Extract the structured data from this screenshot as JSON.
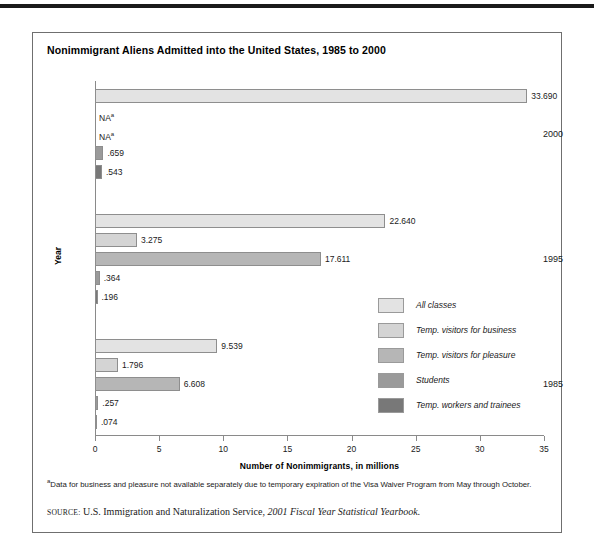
{
  "figure": {
    "title": "Nonimmigrant Aliens Admitted into the United States, 1985 to 2000",
    "footnote_marker": "a",
    "footnote_text": "Data for business and pleasure not available separately due to temporary expiration of the Visa Waiver Program from May through October.",
    "source_keyword": "SOURCE:",
    "source_text": "U.S. Immigration and Naturalization Service,",
    "source_italic": "2001 Fiscal Year Statistical Yearbook."
  },
  "chart_data": {
    "type": "bar",
    "orientation": "horizontal",
    "title": "Nonimmigrant Aliens Admitted into the United States, 1985 to 2000",
    "xlabel": "Number of Nonimmigrants, in millions",
    "ylabel": "Year",
    "xlim": [
      0,
      35
    ],
    "xticks": [
      0,
      5,
      10,
      15,
      20,
      25,
      30,
      35
    ],
    "grid": false,
    "legend_position": "right-middle",
    "categories": [
      "2000",
      "1995",
      "1985"
    ],
    "series": [
      {
        "name": "All classes",
        "color": "#e3e3e3",
        "values": [
          33.69,
          22.64,
          9.539
        ],
        "labels": [
          "33.690",
          "22.640",
          "9.539"
        ]
      },
      {
        "name": "Temp. visitors for business",
        "color": "#d4d4d4",
        "values": [
          null,
          3.275,
          1.796
        ],
        "labels": [
          "NA",
          "3.275",
          "1.796"
        ]
      },
      {
        "name": "Temp. visitors for pleasure",
        "color": "#b6b6b6",
        "values": [
          null,
          17.611,
          6.608
        ],
        "labels": [
          "NA",
          "17.611",
          "6.608"
        ]
      },
      {
        "name": "Students",
        "color": "#9a9a9a",
        "values": [
          0.659,
          0.364,
          0.257
        ],
        "labels": [
          ".659",
          ".364",
          ".257"
        ]
      },
      {
        "name": "Temp. workers and trainees",
        "color": "#787878",
        "values": [
          0.543,
          0.196,
          0.074
        ],
        "labels": [
          ".543",
          ".196",
          ".074"
        ]
      }
    ],
    "na_note_marker": "a"
  },
  "legend": {
    "items": [
      {
        "label": "All classes",
        "color": "#e3e3e3"
      },
      {
        "label": "Temp. visitors for business",
        "color": "#d4d4d4"
      },
      {
        "label": "Temp. visitors for pleasure",
        "color": "#b6b6b6"
      },
      {
        "label": "Students",
        "color": "#9a9a9a"
      },
      {
        "label": "Temp. workers and trainees",
        "color": "#787878"
      }
    ]
  },
  "axis": {
    "x_tick_labels": [
      "0",
      "5",
      "10",
      "15",
      "20",
      "25",
      "30",
      "35"
    ],
    "y_tick_labels": [
      "2000",
      "1995",
      "1985"
    ],
    "x_title": "Number of Nonimmigrants, in millions",
    "y_title": "Year"
  },
  "na_text": "NA"
}
